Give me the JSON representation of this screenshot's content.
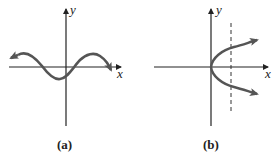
{
  "panels": [
    {
      "id": "a",
      "caption": "(a)",
      "x_label": "x",
      "y_label": "y",
      "curve": "sinusoidal wave crossing x-axis, arrows at both ends"
    },
    {
      "id": "b",
      "caption": "(b)",
      "x_label": "x",
      "y_label": "y",
      "curve": "sideways parabola opening right with vertex at origin, arrows on both branches",
      "vertical_line": "dashed vertical line intersecting both branches"
    }
  ],
  "colors": {
    "axis": "#222222",
    "curve": "#555555"
  }
}
